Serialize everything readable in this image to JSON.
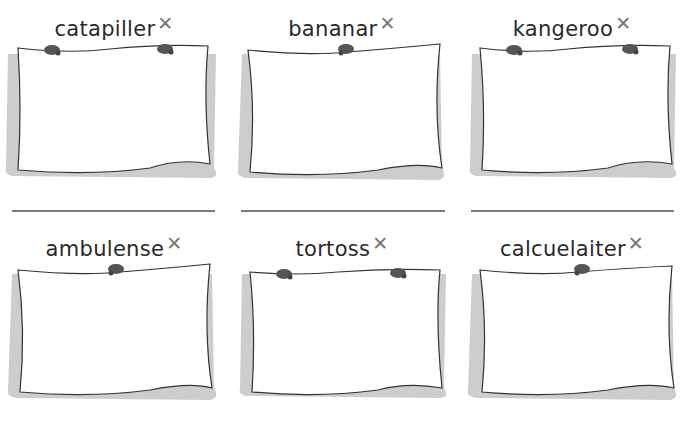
{
  "worksheet": {
    "rows": [
      {
        "cells": [
          {
            "word": "catapiller",
            "mark": "✕",
            "pins": 2
          },
          {
            "word": "bananar",
            "mark": "✕",
            "pins": 1
          },
          {
            "word": "kangeroo",
            "mark": "✕",
            "pins": 2
          }
        ]
      },
      {
        "cells": [
          {
            "word": "ambulense",
            "mark": "✕",
            "pins": 1
          },
          {
            "word": "tortoss",
            "mark": "✕",
            "pins": 2
          },
          {
            "word": "calcuelaiter",
            "mark": "✕",
            "pins": 1
          }
        ]
      }
    ],
    "colors": {
      "text": "#2a2a2a",
      "mark": "#777777",
      "pin": "#555555",
      "shadow": "#b0b0b0",
      "rule": "#7a7a7a"
    }
  }
}
